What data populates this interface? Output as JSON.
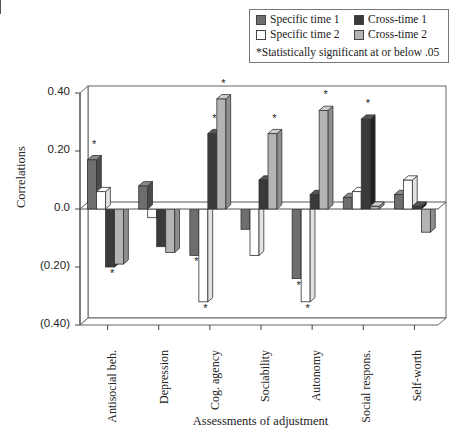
{
  "legend": {
    "items": [
      {
        "label": "Specific time 1",
        "color": "#6e6e6e"
      },
      {
        "label": "Cross-time 1",
        "color": "#3a3a3a"
      },
      {
        "label": "Specific time 2",
        "color": "#ffffff"
      },
      {
        "label": "Cross-time 2",
        "color": "#b4b4b4"
      }
    ],
    "note": "*Statistically significant at or below .05"
  },
  "axes": {
    "ylabel": "Correlations",
    "xlabel": "Assessments of adjustment",
    "yticks": [
      "0.40",
      "0.20",
      "0.0",
      "(0.20)",
      "(0.40)"
    ]
  },
  "chart_data": {
    "type": "bar",
    "title": "",
    "xlabel": "Assessments of adjustment",
    "ylabel": "Correlations",
    "ylim": [
      -0.4,
      0.4
    ],
    "yticks": [
      0.4,
      0.2,
      0.0,
      -0.2,
      -0.4
    ],
    "ytick_labels": [
      "0.40",
      "0.20",
      "0.0",
      "(0.20)",
      "(0.40)"
    ],
    "grid": false,
    "style": "3d-bar",
    "legend_position": "top-right",
    "annotation": "*Statistically significant at or below .05",
    "categories": [
      "Antisocial beh.",
      "Depression",
      "Cog. agency",
      "Sociability",
      "Autonomy",
      "Social respons.",
      "Self-worth"
    ],
    "series": [
      {
        "name": "Specific time 1",
        "values": [
          0.17,
          0.08,
          -0.16,
          -0.07,
          -0.24,
          0.04,
          0.05
        ],
        "significant": [
          true,
          false,
          true,
          false,
          true,
          false,
          false
        ]
      },
      {
        "name": "Specific time 2",
        "values": [
          0.06,
          -0.03,
          -0.32,
          -0.16,
          -0.32,
          0.06,
          0.1
        ],
        "significant": [
          false,
          false,
          true,
          false,
          true,
          false,
          false
        ]
      },
      {
        "name": "Cross-time 1",
        "values": [
          -0.2,
          -0.13,
          0.26,
          0.1,
          0.05,
          0.31,
          0.01
        ],
        "significant": [
          true,
          false,
          true,
          false,
          false,
          true,
          false
        ]
      },
      {
        "name": "Cross-time 2",
        "values": [
          -0.19,
          -0.15,
          0.38,
          0.26,
          0.34,
          0.01,
          -0.08
        ],
        "significant": [
          false,
          false,
          true,
          true,
          true,
          false,
          false
        ]
      }
    ]
  }
}
